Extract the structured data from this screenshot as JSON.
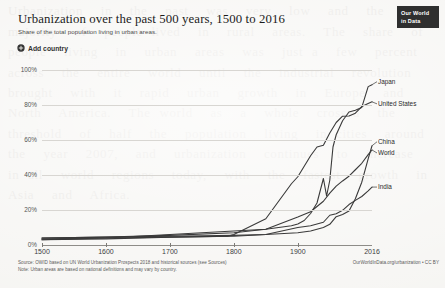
{
  "header": {
    "title": "Urbanization over the past 500 years, 1500 to 2016",
    "subtitle": "Share of the total population living in urban areas.",
    "add_country_label": "Add country",
    "add_country_icon": "plus-circle-icon",
    "logo_line1": "Our World",
    "logo_line2": "in Data"
  },
  "footer": {
    "source": "Source: OWID based on UN World Urbanization Prospects 2018 and historical sources (see Sources)",
    "note": "Note: Urban areas are based on national definitions and may vary by country.",
    "credit": "OurWorldInData.org/urbanization • CC BY"
  },
  "axis": {
    "y_ticks": [
      "0%",
      "20%",
      "40%",
      "60%",
      "80%",
      "100%"
    ],
    "x_ticks": [
      "1500",
      "1600",
      "1700",
      "1800",
      "1900",
      "2016"
    ]
  },
  "chart_data": {
    "type": "line",
    "title": "Urbanization over the past 500 years, 1500 to 2016",
    "subtitle": "Share of the total population living in urban areas.",
    "xlabel": "",
    "ylabel": "Share of total population living in urban areas (%)",
    "xlim": [
      1500,
      2016
    ],
    "ylim": [
      0,
      100
    ],
    "grid": true,
    "legend": "line-end-labels",
    "ytick_values": [
      0,
      20,
      40,
      60,
      80,
      100
    ],
    "xtick_values": [
      1500,
      1600,
      1700,
      1800,
      1900,
      2016
    ],
    "series": [
      {
        "name": "Japan",
        "color": "#3a3a3a",
        "end_value": 91.6,
        "x": [
          1500,
          1600,
          1700,
          1800,
          1850,
          1890,
          1900,
          1910,
          1920,
          1930,
          1940,
          1945,
          1950,
          1955,
          1960,
          1970,
          1980,
          1990,
          2000,
          2010,
          2016
        ],
        "y": [
          3.0,
          4.0,
          6.0,
          8.0,
          9.0,
          11.0,
          12.0,
          14.0,
          18.0,
          24.0,
          38.0,
          28.0,
          37.0,
          56.0,
          63.0,
          71.0,
          76.0,
          77.0,
          78.6,
          90.5,
          91.6
        ]
      },
      {
        "name": "United States",
        "color": "#3a3a3a",
        "end_value": 81.8,
        "x": [
          1500,
          1600,
          1700,
          1790,
          1800,
          1850,
          1870,
          1890,
          1900,
          1910,
          1920,
          1930,
          1940,
          1950,
          1960,
          1970,
          1980,
          1990,
          2000,
          2010,
          2016
        ],
        "y": [
          3.0,
          3.5,
          4.5,
          5.0,
          6.0,
          15.0,
          25.0,
          35.0,
          39.0,
          45.0,
          51.0,
          56.0,
          57.0,
          64.0,
          70.0,
          73.6,
          73.7,
          75.3,
          79.1,
          80.8,
          81.8
        ]
      },
      {
        "name": "China",
        "color": "#3a3a3a",
        "end_value": 56.7,
        "x": [
          1500,
          1600,
          1700,
          1800,
          1850,
          1900,
          1920,
          1940,
          1950,
          1960,
          1970,
          1980,
          1990,
          2000,
          2010,
          2016
        ],
        "y": [
          4.0,
          4.5,
          5.0,
          5.5,
          6.0,
          7.0,
          8.0,
          10.0,
          11.8,
          16.2,
          17.4,
          19.4,
          26.4,
          35.9,
          49.2,
          56.7
        ]
      },
      {
        "name": "World",
        "color": "#3a3a3a",
        "end_value": 54.3,
        "x": [
          1500,
          1600,
          1700,
          1800,
          1850,
          1900,
          1920,
          1940,
          1950,
          1960,
          1970,
          1980,
          1990,
          2000,
          2010,
          2016
        ],
        "y": [
          4.0,
          4.5,
          5.5,
          7.0,
          9.0,
          16.0,
          19.0,
          25.0,
          29.6,
          33.6,
          36.6,
          39.3,
          43.0,
          46.7,
          51.6,
          54.3
        ]
      },
      {
        "name": "India",
        "color": "#3a3a3a",
        "end_value": 33.1,
        "x": [
          1500,
          1600,
          1700,
          1800,
          1850,
          1900,
          1920,
          1940,
          1950,
          1960,
          1970,
          1980,
          1990,
          2000,
          2010,
          2016
        ],
        "y": [
          3.5,
          4.0,
          4.5,
          5.0,
          6.0,
          10.0,
          11.0,
          13.0,
          17.0,
          17.9,
          19.8,
          23.1,
          25.5,
          27.7,
          30.9,
          33.1
        ]
      }
    ]
  },
  "ghost_text": "Urbanization  in  the  past  was  very  low  and  the  vast  majority  of  people lived  in  rural  areas.  The  share  of  people  living  in  urban  areas  was  just a  few  percent  across  the  entire  world  until  the  industrial  revolution brought  with  it  rapid  urban  growth  in  Europe  and  North  America.  The world  as  a  whole  crossed  the  threshold  of  half  the  population  living  in cities  around  the  year  2007,  and  urbanization  continues  to  increase  in all  world  regions  today,  with  the  fastest  growth  in  Asia  and  Africa."
}
